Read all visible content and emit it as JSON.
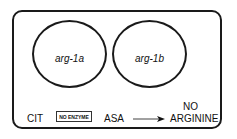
{
  "diagram": {
    "regions": [
      {
        "label": "arg-1a"
      },
      {
        "label": "arg-1b"
      }
    ],
    "pathway": {
      "substrate": "CIT",
      "enzyme_box": "NO ENZYME",
      "intermediate": "ASA",
      "product_line1": "NO",
      "product_line2": "ARGININE"
    }
  }
}
